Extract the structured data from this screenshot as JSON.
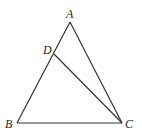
{
  "diagram": {
    "type": "geometry-triangle",
    "points": {
      "A": {
        "label": "A",
        "x": 70,
        "y": 22
      },
      "B": {
        "label": "B",
        "x": 17,
        "y": 123
      },
      "C": {
        "label": "C",
        "x": 122,
        "y": 123
      },
      "D": {
        "label": "D",
        "x": 54,
        "y": 54
      }
    },
    "segments": [
      "AB",
      "AC",
      "BC",
      "DC"
    ],
    "colors": {
      "stroke": "#333333",
      "text": "#222222",
      "background": "#ffffff"
    }
  }
}
